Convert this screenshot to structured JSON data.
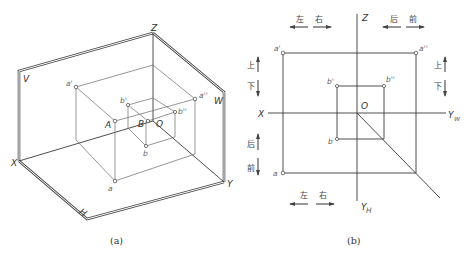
{
  "figure_a": {
    "caption": "(a)",
    "plane_labels": {
      "V": "V",
      "W": "W",
      "H": "H"
    },
    "axis_labels": {
      "X": "X",
      "Y": "Y",
      "Z": "Z"
    },
    "point_labels": {
      "a_prime": "a'",
      "a_double_prime": "a''",
      "A": "A",
      "a": "a",
      "b_prime": "b'",
      "b_double_prime": "b''",
      "B": "B",
      "O": "O",
      "b": "b"
    }
  },
  "figure_b": {
    "caption": "(b)",
    "axis_labels": {
      "X": "X",
      "Z": "Z",
      "Yw": "Y",
      "Yw_sub": "w",
      "Yh": "Y",
      "Yh_sub": "H"
    },
    "origin_label": "O",
    "point_labels": {
      "a_prime": "a'",
      "a_double_prime": "a''",
      "a": "a",
      "b_prime": "b'",
      "b_double_prime": "b''",
      "b": "b"
    },
    "direction_labels": {
      "top_left": {
        "left": "左",
        "right": "右"
      },
      "top_right": {
        "back": "后",
        "front": "前"
      },
      "left_upper": {
        "up": "上",
        "down": "下"
      },
      "right_upper": {
        "up": "上",
        "down": "下"
      },
      "left_lower": {
        "back": "后",
        "front": "前"
      },
      "bottom": {
        "left": "左",
        "right": "右"
      }
    }
  }
}
